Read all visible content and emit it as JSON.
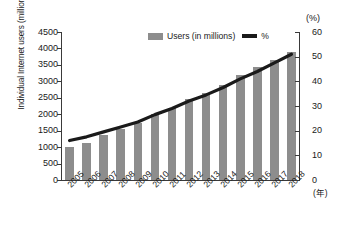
{
  "chart_data": {
    "type": "bar",
    "title": "",
    "subtitle": "",
    "xlabel": "(年)",
    "ylabel": "Individual Internet users (millions)",
    "y2label": "(%)",
    "categories": [
      "2005",
      "2006",
      "2007",
      "2008",
      "2009",
      "2010",
      "2011",
      "2012",
      "2013",
      "2014",
      "2015",
      "2016",
      "2017",
      "2018"
    ],
    "ylim": [
      0,
      4500
    ],
    "y2lim": [
      0,
      60
    ],
    "yticks": [
      0,
      500,
      1000,
      1500,
      2000,
      2500,
      3000,
      3500,
      4000,
      4500
    ],
    "y2ticks": [
      0,
      10,
      20,
      30,
      40,
      50,
      60
    ],
    "grid": false,
    "legend_position": "top-center",
    "series": [
      {
        "name": "Users (in millions)",
        "type": "bar",
        "axis": "left",
        "color": "#8d8d8d",
        "values": [
          1000,
          1130,
          1360,
          1540,
          1730,
          2000,
          2200,
          2450,
          2650,
          2890,
          3200,
          3450,
          3650,
          3900
        ]
      },
      {
        "name": "%",
        "type": "line",
        "axis": "right",
        "color": "#1a1a1a",
        "values": [
          16.0,
          17.5,
          19.5,
          21.5,
          23.5,
          26.5,
          29.0,
          32.0,
          34.5,
          37.5,
          41.0,
          44.0,
          47.5,
          51.0
        ]
      }
    ]
  },
  "legend": {
    "bar_label": "Users (in millions)",
    "line_label": "%"
  },
  "axes": {
    "left_title": "Individual Internet users (millions)",
    "right_unit": "(%)",
    "x_unit": "(年)"
  }
}
